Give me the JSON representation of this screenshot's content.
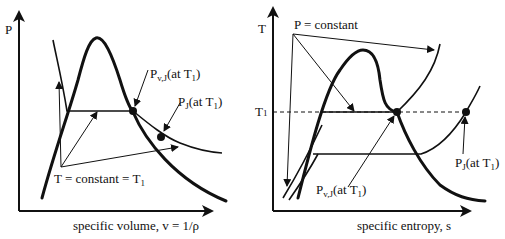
{
  "left_diagram": {
    "y_axis_label": "P",
    "x_axis_label": "specific volume, v = 1/ρ",
    "label_pvj": {
      "main": "P",
      "sub": "v,J",
      "rest": "(at T",
      "rest_sub": "1",
      "close": ")"
    },
    "label_pj": {
      "main": "P",
      "sub": "J",
      "rest": "(at T",
      "rest_sub": "1",
      "close": ")"
    },
    "label_isotherm": {
      "main": "T = constant = T",
      "sub": "1"
    }
  },
  "right_diagram": {
    "y_axis_label": "T",
    "y_tick_label": {
      "main": "T",
      "sub": "1"
    },
    "x_axis_label": "specific entropy, s",
    "label_isobar": "P = constant",
    "label_pvj": {
      "main": "P",
      "sub": "v,J",
      "rest": "(at T",
      "rest_sub": "1",
      "close": ")"
    },
    "label_pj": {
      "main": "P",
      "sub": "J",
      "rest": "(at T",
      "rest_sub": "1",
      "close": ")"
    }
  },
  "colors": {
    "ink": "#111111",
    "background": "#ffffff"
  }
}
